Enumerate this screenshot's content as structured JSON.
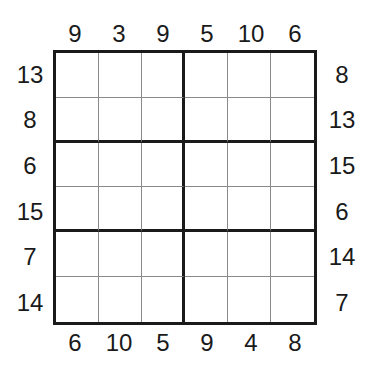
{
  "puzzle": {
    "type": "skyscraper-sum-like 6x6 grid with outside clues",
    "size": 6,
    "regions": "2 columns x 3 rows of 3x2 boxes",
    "clues": {
      "top": [
        "9",
        "3",
        "9",
        "5",
        "10",
        "6"
      ],
      "bottom": [
        "6",
        "10",
        "5",
        "9",
        "4",
        "8"
      ],
      "left": [
        "13",
        "8",
        "6",
        "15",
        "7",
        "14"
      ],
      "right": [
        "8",
        "13",
        "15",
        "6",
        "14",
        "7"
      ]
    },
    "cells": [
      [
        "",
        "",
        "",
        "",
        "",
        ""
      ],
      [
        "",
        "",
        "",
        "",
        "",
        ""
      ],
      [
        "",
        "",
        "",
        "",
        "",
        ""
      ],
      [
        "",
        "",
        "",
        "",
        "",
        ""
      ],
      [
        "",
        "",
        "",
        "",
        "",
        ""
      ],
      [
        "",
        "",
        "",
        "",
        "",
        ""
      ]
    ]
  }
}
